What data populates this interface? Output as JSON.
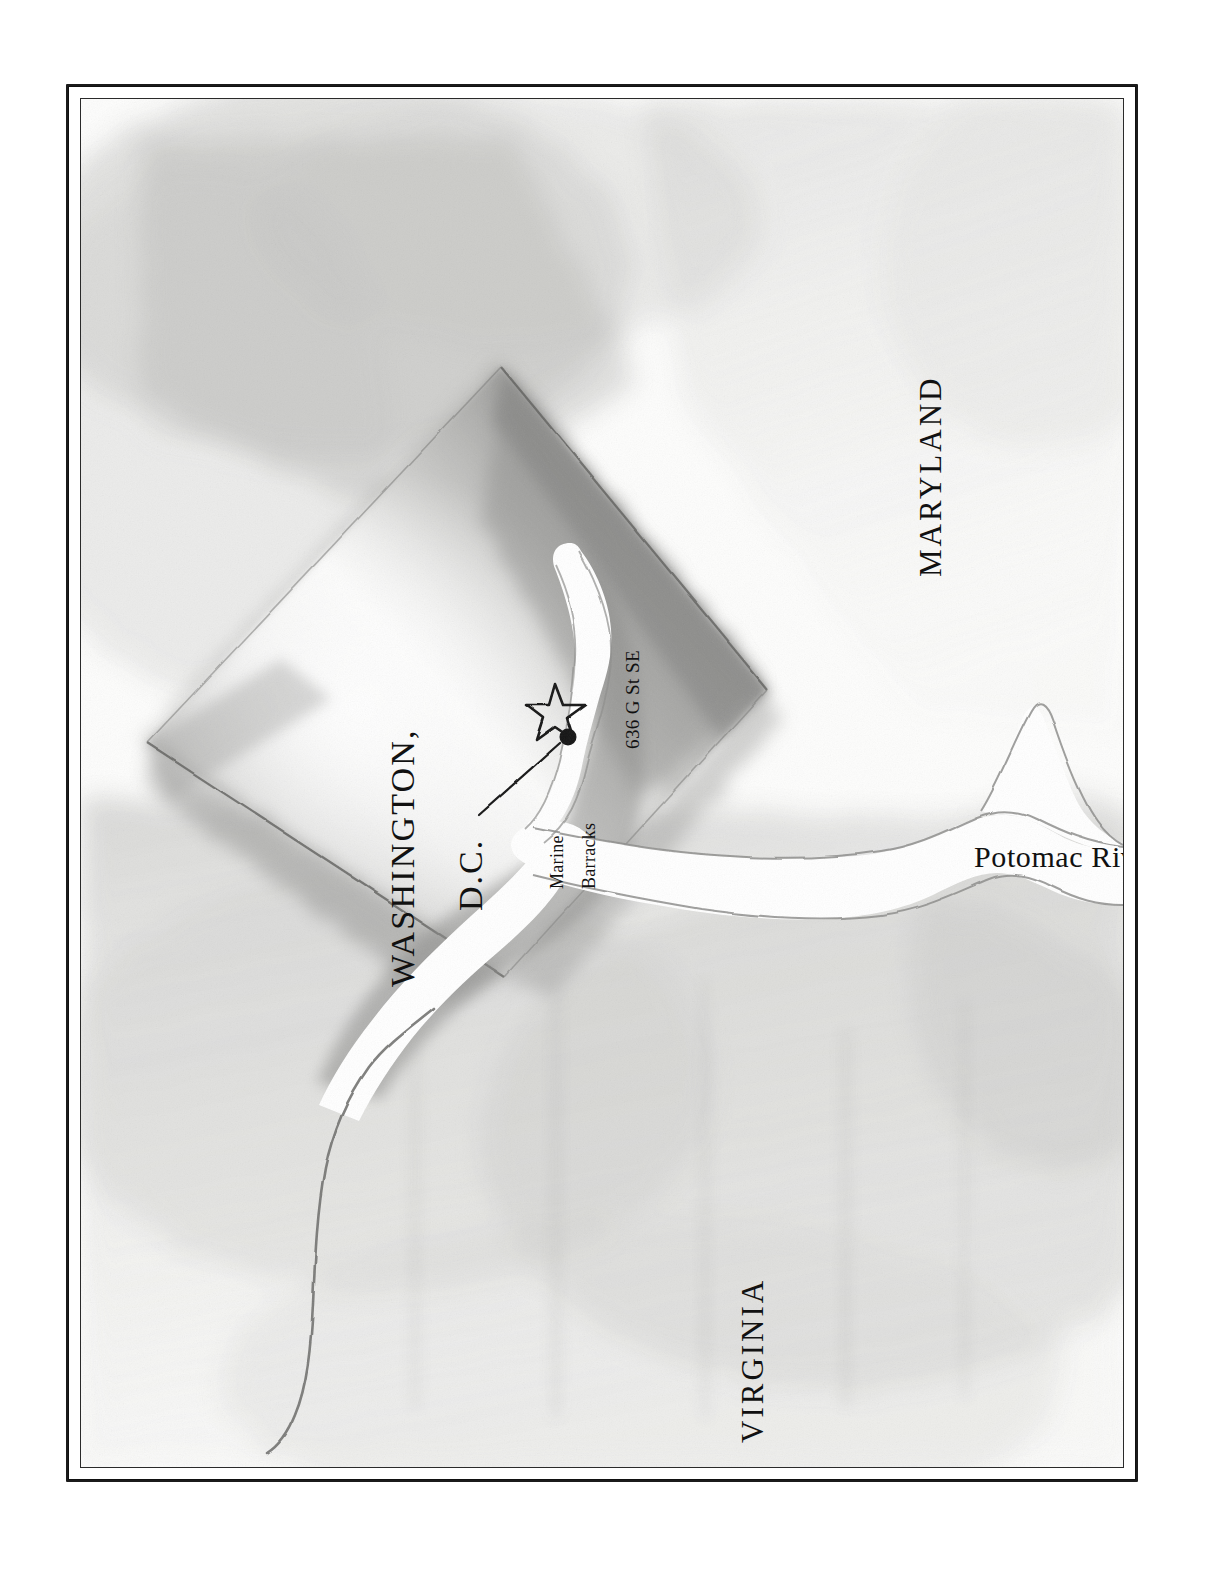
{
  "map": {
    "kind": "hand-drawn pencil location map",
    "subject": "Washington, D.C. and vicinity",
    "labels": {
      "maryland": "MARYLAND",
      "virginia": "VIRGINIA",
      "washington": "WASHINGTON,",
      "district": "D.C.",
      "potomac_river": "Potomac River",
      "address": "636 G St SE",
      "barracks_line1": "Marine",
      "barracks_line2": "Barracks"
    },
    "markers": [
      {
        "name": "star-marker",
        "label": "636 G St SE",
        "shape": "open five-pointed star",
        "x": 556,
        "y": 663
      },
      {
        "name": "barracks-dot",
        "label": "Marine Barracks",
        "shape": "filled circle",
        "x": 568,
        "y": 690
      }
    ],
    "features": [
      {
        "name": "district-diamond",
        "label": "WASHINGTON, D.C.",
        "shape": "shaded diamond"
      },
      {
        "name": "anacostia-river",
        "label": "",
        "shape": "white channel branching north"
      },
      {
        "name": "potomac-river",
        "label": "Potomac River",
        "shape": "white channel running east"
      },
      {
        "name": "virginia-boundary-line",
        "label": "",
        "shape": "thin curving line to lower left"
      }
    ],
    "colors": {
      "paper": "#fdfdfc",
      "ink": "#111111",
      "frame": "#1b1b1b",
      "graphite_light": "#d8d8d6",
      "graphite_mid": "#b4b4b2",
      "graphite_dark": "#8a8a88",
      "water": "#ffffff"
    }
  }
}
